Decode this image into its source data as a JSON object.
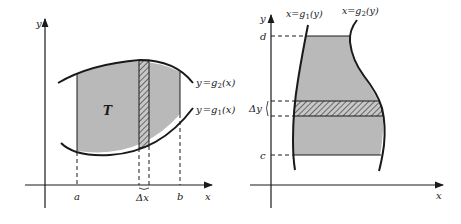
{
  "colors": {
    "background": "#ffffff",
    "ink": "#1a1a1a",
    "region_fill": "#b9b9b9"
  },
  "left_diagram": {
    "axis_x_label": "x",
    "axis_y_label": "y",
    "region_label": "T",
    "tick_a": "a",
    "tick_b": "b",
    "strip_label": "Δx",
    "upper_curve": {
      "lhs": "y",
      "eq": "=",
      "fn": "g",
      "sub": "2",
      "arg": "(x)"
    },
    "lower_curve": {
      "lhs": "y",
      "eq": "=",
      "fn": "g",
      "sub": "1",
      "arg": "(x)"
    }
  },
  "right_diagram": {
    "axis_x_label": "x",
    "axis_y_label": "y",
    "tick_c": "c",
    "tick_d": "d",
    "strip_label": "Δy",
    "left_curve": {
      "lhs": "x",
      "eq": "=",
      "fn": "g",
      "sub": "1",
      "arg": "(y)"
    },
    "right_curve": {
      "lhs": "x",
      "eq": "=",
      "fn": "g",
      "sub": "2",
      "arg": "(y)"
    }
  }
}
